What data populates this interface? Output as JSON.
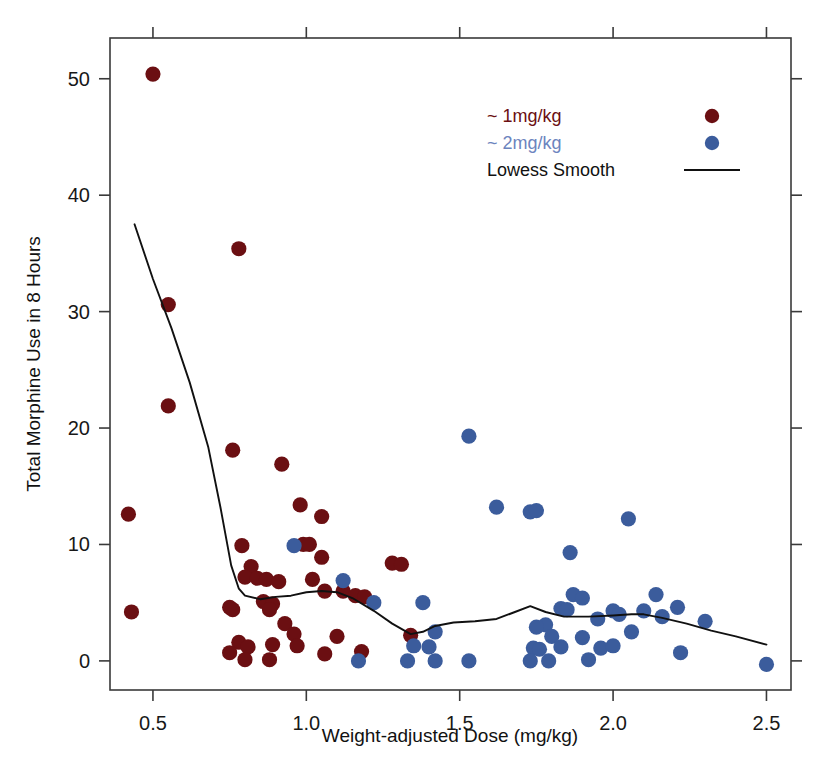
{
  "chart_data": {
    "type": "scatter",
    "title": "",
    "xlabel": "Weight-adjusted Dose (mg/kg)",
    "ylabel": "Total Morphine Use in 8 Hours",
    "xlim": [
      0.36,
      2.58
    ],
    "ylim": [
      -2.5,
      53.5
    ],
    "xticks": [
      0.5,
      1.0,
      1.5,
      2.0,
      2.5
    ],
    "xticklabels": [
      "0.5",
      "1.0",
      "1.5",
      "2.0",
      "2.5"
    ],
    "yticks": [
      0,
      10,
      20,
      30,
      40,
      50
    ],
    "yticklabels": [
      "0",
      "10",
      "20",
      "30",
      "40",
      "50"
    ],
    "grid": false,
    "legend_position": "top-right",
    "colors": {
      "series_1mg": "#6B0F12",
      "series_2mg": "#3B5C9C",
      "lowess": "#111111",
      "axis": "#3a3a3a",
      "background": "#ffffff",
      "text": "#181818"
    },
    "legend": [
      {
        "label": "~ 1mg/kg",
        "marker": "circle",
        "color": "#6B0F12",
        "text_color": "#6B0F12"
      },
      {
        "label": "~ 2mg/kg",
        "marker": "circle",
        "color": "#3B5C9C",
        "text_color": "#6C84BE"
      },
      {
        "label": "Lowess Smooth",
        "marker": "line",
        "color": "#111111",
        "text_color": "#111111"
      }
    ],
    "series": [
      {
        "name": "~ 1mg/kg",
        "color": "#6B0F12",
        "marker": "circle",
        "points": [
          [
            0.5,
            50.4
          ],
          [
            0.55,
            30.6
          ],
          [
            0.78,
            35.4
          ],
          [
            0.55,
            21.9
          ],
          [
            0.76,
            18.1
          ],
          [
            0.92,
            16.9
          ],
          [
            0.42,
            12.6
          ],
          [
            1.05,
            12.4
          ],
          [
            0.98,
            13.4
          ],
          [
            0.79,
            9.9
          ],
          [
            0.99,
            10.0
          ],
          [
            1.01,
            10.0
          ],
          [
            1.05,
            8.9
          ],
          [
            0.82,
            8.1
          ],
          [
            0.8,
            7.2
          ],
          [
            0.84,
            7.1
          ],
          [
            0.87,
            7.0
          ],
          [
            1.02,
            7.0
          ],
          [
            0.91,
            6.8
          ],
          [
            1.12,
            6.0
          ],
          [
            1.06,
            6.0
          ],
          [
            1.16,
            5.6
          ],
          [
            1.19,
            5.5
          ],
          [
            0.86,
            5.1
          ],
          [
            0.89,
            4.9
          ],
          [
            0.88,
            4.4
          ],
          [
            1.28,
            8.4
          ],
          [
            1.31,
            8.3
          ],
          [
            0.43,
            4.2
          ],
          [
            0.75,
            4.6
          ],
          [
            0.76,
            4.4
          ],
          [
            0.93,
            3.2
          ],
          [
            0.96,
            2.3
          ],
          [
            1.1,
            2.1
          ],
          [
            1.34,
            2.2
          ],
          [
            0.78,
            1.6
          ],
          [
            0.81,
            1.2
          ],
          [
            0.89,
            1.4
          ],
          [
            0.97,
            1.3
          ],
          [
            1.18,
            0.8
          ],
          [
            0.75,
            0.7
          ],
          [
            0.8,
            0.1
          ],
          [
            0.88,
            0.1
          ],
          [
            1.06,
            0.6
          ]
        ]
      },
      {
        "name": "~ 2mg/kg",
        "color": "#3B5C9C",
        "marker": "circle",
        "points": [
          [
            1.53,
            19.3
          ],
          [
            1.62,
            13.2
          ],
          [
            1.73,
            12.8
          ],
          [
            1.75,
            12.9
          ],
          [
            2.05,
            12.2
          ],
          [
            1.86,
            9.3
          ],
          [
            0.96,
            9.9
          ],
          [
            1.12,
            6.9
          ],
          [
            1.22,
            5.0
          ],
          [
            1.87,
            5.7
          ],
          [
            2.14,
            5.7
          ],
          [
            1.9,
            5.4
          ],
          [
            1.38,
            5.0
          ],
          [
            1.83,
            4.5
          ],
          [
            1.85,
            4.4
          ],
          [
            2.0,
            4.3
          ],
          [
            2.1,
            4.3
          ],
          [
            2.02,
            4.0
          ],
          [
            2.21,
            4.6
          ],
          [
            2.16,
            3.8
          ],
          [
            1.95,
            3.6
          ],
          [
            2.3,
            3.4
          ],
          [
            1.78,
            3.1
          ],
          [
            1.75,
            2.9
          ],
          [
            1.42,
            2.5
          ],
          [
            2.06,
            2.5
          ],
          [
            1.8,
            2.1
          ],
          [
            1.9,
            2.0
          ],
          [
            1.35,
            1.3
          ],
          [
            1.4,
            1.2
          ],
          [
            1.74,
            1.1
          ],
          [
            1.76,
            1.0
          ],
          [
            1.83,
            1.2
          ],
          [
            1.96,
            1.1
          ],
          [
            2.0,
            1.3
          ],
          [
            2.22,
            0.7
          ],
          [
            1.17,
            0.0
          ],
          [
            1.33,
            0.0
          ],
          [
            1.42,
            0.0
          ],
          [
            1.53,
            0.0
          ],
          [
            1.73,
            0.0
          ],
          [
            1.79,
            0.0
          ],
          [
            1.92,
            0.1
          ],
          [
            2.5,
            -0.3
          ]
        ]
      }
    ],
    "lowess": {
      "name": "Lowess Smooth",
      "color": "#111111",
      "points": [
        [
          0.44,
          37.5
        ],
        [
          0.5,
          32.8
        ],
        [
          0.56,
          28.6
        ],
        [
          0.62,
          23.9
        ],
        [
          0.68,
          18.4
        ],
        [
          0.72,
          13.2
        ],
        [
          0.755,
          8.2
        ],
        [
          0.78,
          6.2
        ],
        [
          0.8,
          5.6
        ],
        [
          0.85,
          5.3
        ],
        [
          0.9,
          5.5
        ],
        [
          0.95,
          5.6
        ],
        [
          1.0,
          5.9
        ],
        [
          1.05,
          6.0
        ],
        [
          1.1,
          5.9
        ],
        [
          1.15,
          5.4
        ],
        [
          1.22,
          4.3
        ],
        [
          1.28,
          3.2
        ],
        [
          1.34,
          2.3
        ],
        [
          1.38,
          2.5
        ],
        [
          1.42,
          3.0
        ],
        [
          1.48,
          3.3
        ],
        [
          1.55,
          3.4
        ],
        [
          1.62,
          3.6
        ],
        [
          1.68,
          4.2
        ],
        [
          1.73,
          4.7
        ],
        [
          1.78,
          4.2
        ],
        [
          1.84,
          3.8
        ],
        [
          1.92,
          3.8
        ],
        [
          2.0,
          3.9
        ],
        [
          2.06,
          4.0
        ],
        [
          2.1,
          4.0
        ],
        [
          2.16,
          3.7
        ],
        [
          2.24,
          3.2
        ],
        [
          2.32,
          2.6
        ],
        [
          2.4,
          2.1
        ],
        [
          2.5,
          1.4
        ]
      ]
    }
  },
  "axes": {
    "x_title": "Weight-adjusted Dose (mg/kg)",
    "y_title": "Total Morphine Use in 8 Hours"
  }
}
